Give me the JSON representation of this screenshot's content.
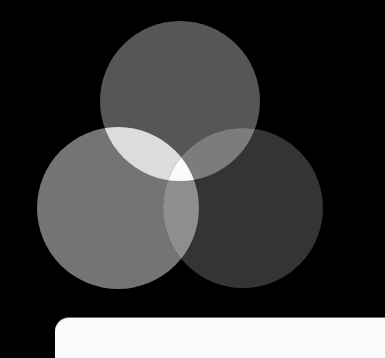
{
  "diagram": {
    "type": "venn",
    "background": "#000000",
    "circles": [
      {
        "name": "top",
        "cx": 180,
        "cy": 101,
        "r": 80,
        "color": "#565656"
      },
      {
        "name": "left",
        "cx": 118,
        "cy": 208,
        "r": 81,
        "color": "#747474"
      },
      {
        "name": "right",
        "cx": 243,
        "cy": 208,
        "r": 80,
        "color": "#343434"
      }
    ],
    "overlaps": {
      "top_left": "#dcdcdc",
      "top_right": "#7c7c7c",
      "left_right": "#8e8e8e",
      "center": "#fafafa"
    }
  },
  "panel": {
    "color": "#fbfbfb"
  }
}
